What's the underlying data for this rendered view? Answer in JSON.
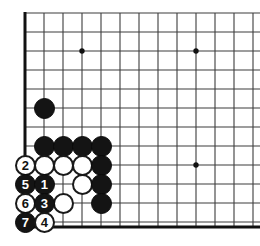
{
  "figure": {
    "kind": "go-board-diagram",
    "title": "",
    "board_size": 19,
    "view": "bottom-left corner",
    "background_color": "#ffffff",
    "line_color": "#3c3c3c",
    "edge_color": "#111111",
    "black_color": "#141414",
    "white_color": "#ffffff"
  },
  "geometry": {
    "origin_x": 25,
    "origin_y": 13,
    "spacing": 19,
    "cols": 13,
    "rows": 12,
    "stone_diameter": 21,
    "edge_left_x": 25,
    "edge_bottom_y": 227
  },
  "star_points": [
    {
      "name": "hoshi-upper-left",
      "cx": 82,
      "cy": 51
    },
    {
      "name": "hoshi-upper-right",
      "cx": 196,
      "cy": 51
    },
    {
      "name": "hoshi-lower-right",
      "cx": 196,
      "cy": 165
    }
  ],
  "stones": [
    {
      "id": "b-d10",
      "color": "black",
      "label": "",
      "cx": 44,
      "cy": 108
    },
    {
      "id": "b-d7a",
      "color": "black",
      "label": "",
      "cx": 44,
      "cy": 146
    },
    {
      "id": "b-d7b",
      "color": "black",
      "label": "",
      "cx": 63,
      "cy": 146
    },
    {
      "id": "b-d7c",
      "color": "black",
      "label": "",
      "cx": 82,
      "cy": 146
    },
    {
      "id": "b-d7d",
      "color": "black",
      "label": "",
      "cx": 101,
      "cy": 146
    },
    {
      "id": "w-c6a",
      "color": "white",
      "label": "",
      "cx": 44,
      "cy": 165
    },
    {
      "id": "w-c6b",
      "color": "white",
      "label": "",
      "cx": 63,
      "cy": 165
    },
    {
      "id": "w-c6c",
      "color": "white",
      "label": "",
      "cx": 82,
      "cy": 165
    },
    {
      "id": "b-e6",
      "color": "black",
      "label": "",
      "cx": 101,
      "cy": 165
    },
    {
      "id": "w-c5",
      "color": "white",
      "label": "",
      "cx": 82,
      "cy": 184
    },
    {
      "id": "b-e5",
      "color": "black",
      "label": "",
      "cx": 101,
      "cy": 184
    },
    {
      "id": "w-c4",
      "color": "white",
      "label": "",
      "cx": 63,
      "cy": 203
    },
    {
      "id": "b-e4",
      "color": "black",
      "label": "",
      "cx": 101,
      "cy": 203
    },
    {
      "id": "move-2",
      "color": "white",
      "label": "2",
      "cx": 25,
      "cy": 165
    },
    {
      "id": "move-5",
      "color": "black",
      "label": "5",
      "cx": 25,
      "cy": 184
    },
    {
      "id": "move-1",
      "color": "black",
      "label": "1",
      "cx": 44,
      "cy": 184
    },
    {
      "id": "move-6",
      "color": "white",
      "label": "6",
      "cx": 25,
      "cy": 203
    },
    {
      "id": "move-3",
      "color": "black",
      "label": "3",
      "cx": 44,
      "cy": 203
    },
    {
      "id": "move-7",
      "color": "black",
      "label": "7",
      "cx": 25,
      "cy": 222
    },
    {
      "id": "move-4",
      "color": "white",
      "label": "4",
      "cx": 44,
      "cy": 222
    }
  ]
}
